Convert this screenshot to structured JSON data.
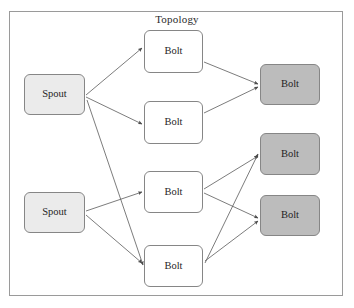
{
  "diagram": {
    "title": "Topology",
    "frame": {
      "x": 9,
      "y": 11,
      "width": 334,
      "height": 285,
      "border_color": "#9a9a9a"
    },
    "colors": {
      "spout_fill": "#ebebeb",
      "bolt_fill": "#ffffff",
      "bolt_sink_fill": "#bcbcbc",
      "node_border": "#868686",
      "edge": "#5a5a5a",
      "text": "#1f1f1f",
      "background": "#ffffff"
    },
    "nodes": [
      {
        "id": "spout1",
        "label": "Spout",
        "type": "spout",
        "x": 24,
        "y": 74,
        "width": 61,
        "height": 41
      },
      {
        "id": "spout2",
        "label": "Spout",
        "type": "spout",
        "x": 24,
        "y": 192,
        "width": 61,
        "height": 41
      },
      {
        "id": "bolt1",
        "label": "Bolt",
        "type": "bolt",
        "x": 144,
        "y": 30,
        "width": 59,
        "height": 43
      },
      {
        "id": "bolt2",
        "label": "Bolt",
        "type": "bolt",
        "x": 144,
        "y": 101,
        "width": 59,
        "height": 43
      },
      {
        "id": "bolt3",
        "label": "Bolt",
        "type": "bolt",
        "x": 144,
        "y": 171,
        "width": 59,
        "height": 42
      },
      {
        "id": "bolt4",
        "label": "Bolt",
        "type": "bolt",
        "x": 144,
        "y": 245,
        "width": 59,
        "height": 42
      },
      {
        "id": "sink1",
        "label": "Bolt",
        "type": "bolt_sink",
        "x": 260,
        "y": 64,
        "width": 60,
        "height": 41
      },
      {
        "id": "sink2",
        "label": "Bolt",
        "type": "bolt_sink",
        "x": 260,
        "y": 133,
        "width": 60,
        "height": 42
      },
      {
        "id": "sink3",
        "label": "Bolt",
        "type": "bolt_sink",
        "x": 260,
        "y": 195,
        "width": 60,
        "height": 41
      }
    ],
    "edges": [
      {
        "from": "spout1",
        "to": "bolt1",
        "x1": 86,
        "y1": 95,
        "x2": 142,
        "y2": 48
      },
      {
        "from": "spout1",
        "to": "bolt2",
        "x1": 86,
        "y1": 97,
        "x2": 142,
        "y2": 124
      },
      {
        "from": "spout1",
        "to": "bolt4",
        "x1": 87,
        "y1": 100,
        "x2": 143,
        "y2": 265
      },
      {
        "from": "spout2",
        "to": "bolt3",
        "x1": 86,
        "y1": 211,
        "x2": 142,
        "y2": 192
      },
      {
        "from": "spout2",
        "to": "bolt4",
        "x1": 86,
        "y1": 215,
        "x2": 142,
        "y2": 263
      },
      {
        "from": "bolt1",
        "to": "sink1",
        "x1": 204,
        "y1": 62,
        "x2": 258,
        "y2": 84
      },
      {
        "from": "bolt2",
        "to": "sink1",
        "x1": 204,
        "y1": 113,
        "x2": 258,
        "y2": 87
      },
      {
        "from": "bolt3",
        "to": "sink2",
        "x1": 204,
        "y1": 189,
        "x2": 258,
        "y2": 156
      },
      {
        "from": "bolt3",
        "to": "sink3",
        "x1": 204,
        "y1": 193,
        "x2": 258,
        "y2": 218
      },
      {
        "from": "bolt4",
        "to": "sink2",
        "x1": 205,
        "y1": 263,
        "x2": 258,
        "y2": 154
      },
      {
        "from": "bolt4",
        "to": "sink3",
        "x1": 205,
        "y1": 261,
        "x2": 258,
        "y2": 221
      }
    ]
  }
}
